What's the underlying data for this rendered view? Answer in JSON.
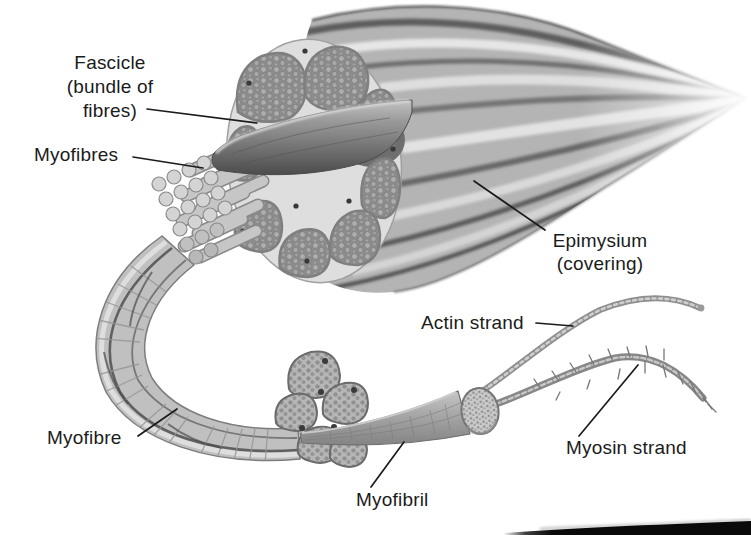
{
  "labels": {
    "fascicle": {
      "line1": "Fascicle",
      "line2": "(bundle of",
      "line3": "fibres)"
    },
    "myofibres": {
      "text": "Myofibres"
    },
    "epimysium": {
      "line1": "Epimysium",
      "line2": "(covering)"
    },
    "actin_strand": {
      "text": "Actin strand"
    },
    "myosin_strand": {
      "text": "Myosin strand"
    },
    "myofibre": {
      "text": "Myofibre"
    },
    "myofibril": {
      "text": "Myofibril"
    }
  },
  "colors": {
    "background": "#ffffff",
    "label_text": "#1b1b1b",
    "leader_line": "#1b1b1b",
    "illustration_dark_gray": "#4f4f4f",
    "illustration_mid_gray": "#a8a8a8",
    "illustration_light_gray": "#e2e2e2",
    "bottom_strip": "#0a0a0a"
  }
}
